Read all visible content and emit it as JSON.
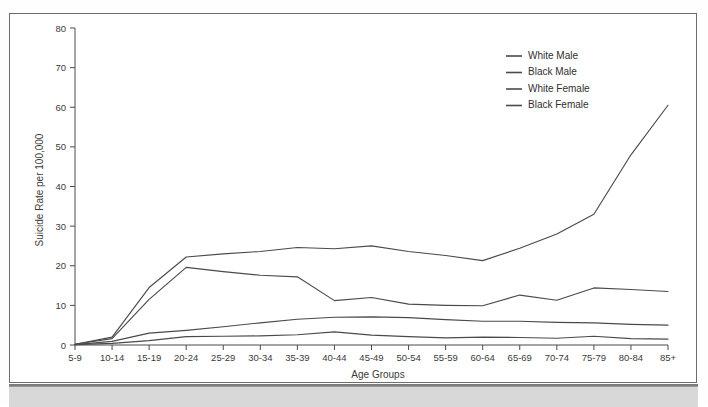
{
  "figure": {
    "border_color": "#6d6d6d",
    "background": "#ffffff",
    "line_color": "#4a4a4a"
  },
  "axis": {
    "y_title": "Suicide Rate per 100,000",
    "x_title": "Age Groups"
  },
  "chart_data": {
    "type": "line",
    "title": "",
    "xlabel": "Age Groups",
    "ylabel": "Suicide Rate per 100,000",
    "ylim": [
      0,
      80
    ],
    "yticks": [
      0,
      10,
      20,
      30,
      40,
      50,
      60,
      70,
      80
    ],
    "ytick_labels": [
      "0",
      "10",
      "20",
      "30",
      "40",
      "50",
      "60",
      "70",
      "80"
    ],
    "grid": false,
    "legend_position": "top-right",
    "categories": [
      "5-9",
      "10-14",
      "15-19",
      "20-24",
      "25-29",
      "30-34",
      "35-39",
      "40-44",
      "45-49",
      "50-54",
      "55-59",
      "60-64",
      "65-69",
      "70-74",
      "75-79",
      "80-84",
      "85+"
    ],
    "series": [
      {
        "name": "White Male",
        "values": [
          0.2,
          2.0,
          14.5,
          22.2,
          23.0,
          23.6,
          24.6,
          24.3,
          25.0,
          23.6,
          22.6,
          21.3,
          24.4,
          28.0,
          33.0,
          48.0,
          60.5
        ]
      },
      {
        "name": "Black Male",
        "values": [
          0.2,
          1.6,
          11.5,
          19.6,
          18.5,
          17.6,
          17.2,
          11.2,
          12.0,
          10.3,
          10.0,
          9.9,
          12.6,
          11.3,
          14.4,
          14.0,
          13.5
        ]
      },
      {
        "name": "White Female",
        "values": [
          0.1,
          0.9,
          3.0,
          3.7,
          4.6,
          5.6,
          6.5,
          7.0,
          7.1,
          6.9,
          6.4,
          6.0,
          6.0,
          5.7,
          5.6,
          5.2,
          5.0
        ]
      },
      {
        "name": "Black Female",
        "values": [
          0.1,
          0.4,
          1.1,
          2.1,
          2.2,
          2.3,
          2.6,
          3.3,
          2.5,
          2.1,
          1.8,
          2.0,
          1.9,
          1.7,
          2.2,
          1.6,
          1.5
        ]
      }
    ]
  },
  "legend": {
    "entries": [
      {
        "label": "White Male"
      },
      {
        "label": "Black Male"
      },
      {
        "label": "White Female"
      },
      {
        "label": "Black Female"
      }
    ]
  }
}
